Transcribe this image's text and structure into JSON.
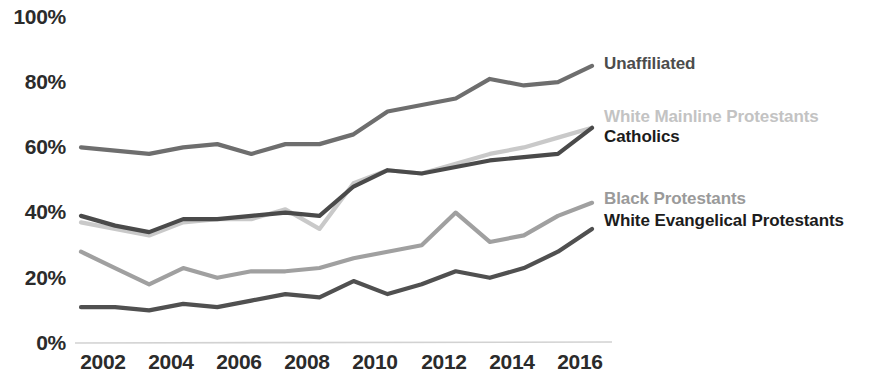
{
  "axis": {
    "y_ticks": [
      "100%",
      "80%",
      "60%",
      "40%",
      "20%",
      "0%"
    ],
    "x_ticks": [
      "2002",
      "2004",
      "2006",
      "2008",
      "2010",
      "2012",
      "2014",
      "2016"
    ]
  },
  "legend": {
    "unaffiliated": "Unaffiliated",
    "white_mainline": "White Mainline Protestants",
    "catholics": "Catholics",
    "black_protestants": "Black Protestants",
    "white_evangelical": "White Evangelical Protestants"
  },
  "colors": {
    "unaffiliated": "#6e6e6e",
    "white_mainline": "#c9c9c9",
    "catholics": "#4a4a4a",
    "black_protestants": "#a0a0a0",
    "white_evangelical": "#505050",
    "axis_line": "#cfcfcf",
    "tick_text": "#2b2b2b",
    "background": "#ffffff"
  },
  "chart_data": {
    "type": "line",
    "title": "",
    "xlabel": "",
    "ylabel": "",
    "xlim": [
      2002,
      2017
    ],
    "ylim": [
      0,
      100
    ],
    "grid": false,
    "legend_position": "right-inline",
    "x": [
      2002,
      2003,
      2004,
      2005,
      2006,
      2007,
      2008,
      2009,
      2010,
      2011,
      2012,
      2013,
      2014,
      2015,
      2016,
      2017
    ],
    "series": [
      {
        "name": "Unaffiliated",
        "color": "#6e6e6e",
        "values": [
          60,
          59,
          58,
          60,
          61,
          58,
          61,
          61,
          64,
          71,
          73,
          75,
          81,
          79,
          80,
          85
        ]
      },
      {
        "name": "White Mainline Protestants",
        "color": "#c9c9c9",
        "values": [
          37,
          35,
          33,
          37,
          38,
          38,
          41,
          35,
          49,
          53,
          52,
          55,
          58,
          60,
          63,
          66
        ]
      },
      {
        "name": "Catholics",
        "color": "#4a4a4a",
        "values": [
          39,
          36,
          34,
          38,
          38,
          39,
          40,
          39,
          48,
          53,
          52,
          54,
          56,
          57,
          58,
          66
        ]
      },
      {
        "name": "Black Protestants",
        "color": "#a0a0a0",
        "values": [
          28,
          23,
          18,
          23,
          20,
          22,
          22,
          23,
          26,
          28,
          30,
          40,
          31,
          33,
          39,
          43
        ]
      },
      {
        "name": "White Evangelical Protestants",
        "color": "#505050",
        "values": [
          11,
          11,
          10,
          12,
          11,
          13,
          15,
          14,
          19,
          15,
          18,
          22,
          20,
          23,
          28,
          35
        ]
      }
    ]
  },
  "geometry": {
    "plot_left": 81,
    "plot_right": 592,
    "y_zero": 343,
    "y_hundred": 17
  }
}
